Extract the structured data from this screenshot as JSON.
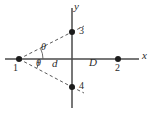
{
  "figure": {
    "type": "geometry-diagram",
    "background_color": "#ffffff",
    "stroke_color": "#4a4a4a",
    "dash_color": "#5a5a5a",
    "dot_color": "#1c1c1c",
    "axes": {
      "x_axis_label": "x",
      "y_axis_label": "y",
      "x_axis": {
        "x1": 5,
        "y1": 59,
        "x2": 139,
        "y2": 59
      },
      "y_axis": {
        "x1": 72,
        "y1": 8,
        "x2": 72,
        "y2": 108
      },
      "origin": {
        "x": 72,
        "y": 59
      }
    },
    "points": [
      {
        "id": "1",
        "label": "1",
        "x": 19,
        "y": 59,
        "label_x": 14,
        "label_y": 63
      },
      {
        "id": "2",
        "label": "2",
        "x": 118,
        "y": 59,
        "label_x": 115,
        "label_y": 63
      },
      {
        "id": "3",
        "label": "3",
        "x": 72,
        "y": 32,
        "label_x": 78,
        "label_y": 26
      },
      {
        "id": "4",
        "label": "4",
        "x": 72,
        "y": 87,
        "label_x": 78,
        "label_y": 81
      }
    ],
    "rays": [
      {
        "name": "ray-1-to-3",
        "x1": 19,
        "y1": 59,
        "x2": 72,
        "y2": 32,
        "style": "dashed"
      },
      {
        "name": "ray-1-to-4",
        "x1": 19,
        "y1": 59,
        "x2": 72,
        "y2": 87,
        "style": "dashed"
      }
    ],
    "ray_extensions": [
      {
        "name": "ray-3-extended",
        "x1": 72,
        "y1": 32,
        "x2": 82,
        "y2": 27,
        "style": "dashed"
      },
      {
        "name": "ray-4-extended",
        "x1": 72,
        "y1": 87,
        "x2": 82,
        "y2": 92,
        "style": "dashed"
      }
    ],
    "angles": [
      {
        "name": "theta-upper",
        "label": "θ",
        "label_x": 40,
        "label_y": 44,
        "arc_cx": 19,
        "arc_cy": 59,
        "arc_r": 24
      },
      {
        "name": "theta-lower",
        "label": "θ",
        "label_x": 35,
        "label_y": 60,
        "arc_cx": 19,
        "arc_cy": 59,
        "arc_r": 20
      }
    ],
    "distances": [
      {
        "name": "distance-d",
        "label": "d",
        "x": 52,
        "y": 60
      },
      {
        "name": "distance-D",
        "label": "D",
        "x": 90,
        "y": 59
      }
    ],
    "axis_labels": [
      {
        "name": "x-axis-label",
        "label": "x",
        "x": 142,
        "y": 52
      },
      {
        "name": "y-axis-label",
        "label": "y",
        "x": 74,
        "y": 0
      }
    ]
  }
}
